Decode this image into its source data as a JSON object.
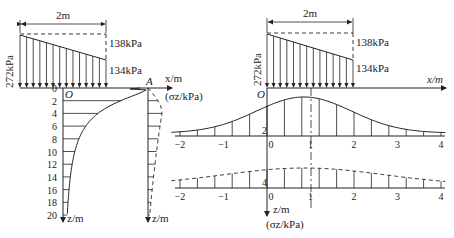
{
  "left_figure": {
    "width_label": "2m",
    "load_left_label": "272kPa",
    "load_mid_label": "138kPa",
    "load_right_label": "134kPa",
    "origin_label": "O",
    "point_a_label": "A",
    "x_axis_label": "x/m",
    "stress_label": "(σz/kPa)",
    "z_axis_label_1": "z/m",
    "z_axis_label_2": "z/m",
    "depth_ticks": [
      "0",
      "2",
      "4",
      "6",
      "8",
      "10",
      "12",
      "14",
      "16",
      "18",
      "20"
    ]
  },
  "right_figure": {
    "width_label": "2m",
    "load_left_label": "272kPa",
    "load_mid_label": "138kPa",
    "load_right_label": "134kPa",
    "origin_label": "O",
    "x_axis_label": "x/m",
    "z_axis_label": "z/m",
    "stress_label": "(σz/kPa)",
    "profile_1_depth": "2",
    "profile_2_depth": "4",
    "x_ticks_1": [
      "−2",
      "−1",
      "0",
      "1",
      "2",
      "3",
      "4"
    ],
    "x_ticks_2": [
      "−2",
      "−1",
      "0",
      "1",
      "2",
      "3",
      "4"
    ]
  }
}
